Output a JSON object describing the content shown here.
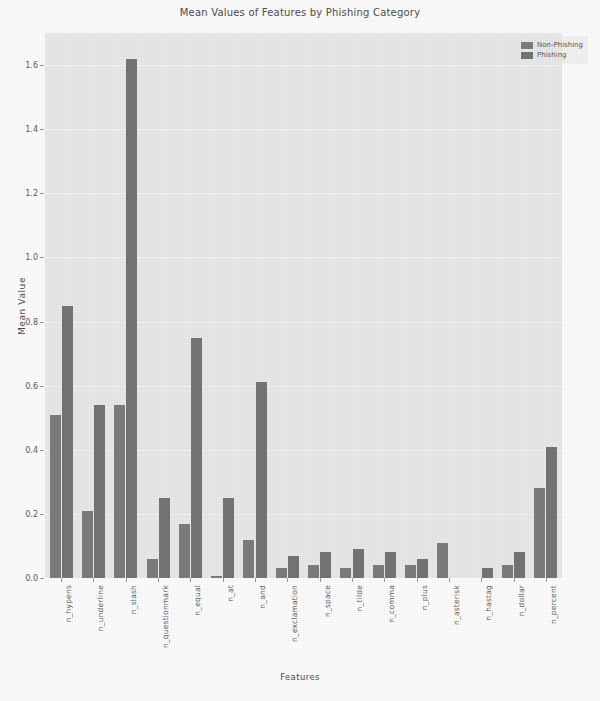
{
  "chart_data": {
    "type": "bar",
    "title": "Mean Values of Features by Phishing Category",
    "xlabel": "Features",
    "ylabel": "Mean Value",
    "ylim": [
      0.0,
      1.7
    ],
    "grid": true,
    "legend_position": "upper right",
    "yticks": [
      "0.0",
      "0.2",
      "0.4",
      "0.6",
      "0.8",
      "1.0",
      "1.2",
      "1.4",
      "1.6"
    ],
    "ytick_values": [
      0.0,
      0.2,
      0.4,
      0.6,
      0.8,
      1.0,
      1.2,
      1.4,
      1.6
    ],
    "categories": [
      "n_hypens",
      "n_underline",
      "n_slash",
      "n_questionmark",
      "n_equal",
      "n_at",
      "n_and",
      "n_exclamation",
      "n_space",
      "n_tilde",
      "n_comma",
      "n_plus",
      "n_asterisk",
      "n_hastag",
      "n_dollar",
      "n_percent"
    ],
    "series": [
      {
        "name": "Non-Phishing",
        "color": "#7d7d7d",
        "values": [
          0.51,
          0.21,
          0.54,
          0.06,
          0.17,
          0.005,
          0.12,
          0.03,
          0.04,
          0.03,
          0.04,
          0.04,
          0.11,
          0.0,
          0.04,
          0.28
        ]
      },
      {
        "name": "Phishing",
        "color": "#757575",
        "values": [
          0.85,
          0.54,
          1.62,
          0.25,
          0.75,
          0.25,
          0.61,
          0.07,
          0.08,
          0.09,
          0.08,
          0.06,
          0.0,
          0.03,
          0.08,
          0.41
        ]
      }
    ]
  },
  "legend": {
    "items": [
      {
        "label": "Non-Phishing"
      },
      {
        "label": "Phishing"
      }
    ]
  }
}
